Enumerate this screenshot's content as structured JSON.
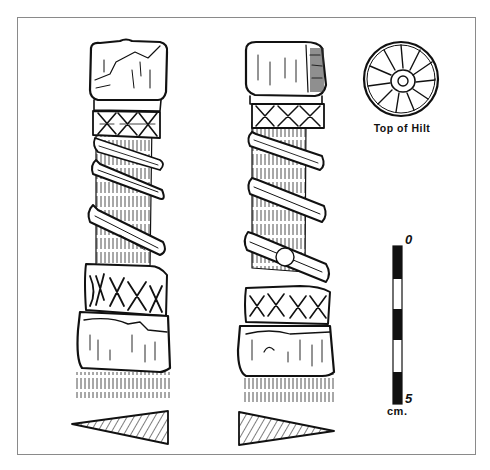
{
  "figure": {
    "views": [
      {
        "id": "left-view",
        "label": ""
      },
      {
        "id": "right-view",
        "label": ""
      }
    ],
    "top_detail": {
      "caption": "Top of Hilt"
    },
    "scale_bar": {
      "start_label": "0",
      "end_label": "5",
      "unit_label": "cm.",
      "segments": [
        "black",
        "white",
        "black",
        "white",
        "black"
      ]
    },
    "cross_sections": [
      {
        "id": "left-section",
        "pattern": "hatched"
      },
      {
        "id": "right-section",
        "pattern": "hatched"
      }
    ],
    "colors": {
      "ink": "#111111",
      "paper": "#ffffff",
      "frame": "#8a8a8a"
    }
  }
}
